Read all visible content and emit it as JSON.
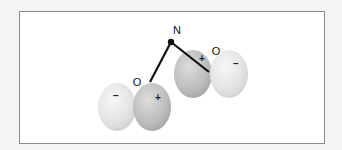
{
  "diagram": {
    "type": "molecular-polarity",
    "colors": {
      "background": "#f4f4f4",
      "frame_fill": "#ffffff",
      "frame_border": "#8a8a8a",
      "bond": "#111111",
      "negative_lobe": "#e6e6e6",
      "positive_lobe": "#bdbdbd"
    },
    "center_atom": {
      "label": "N"
    },
    "groups": [
      {
        "label": "O",
        "lobes": [
          {
            "sign": "−",
            "charge": "negative"
          },
          {
            "sign": "+",
            "charge": "positive"
          }
        ]
      },
      {
        "label": "O",
        "lobes": [
          {
            "sign": "+",
            "charge": "positive"
          },
          {
            "sign": "−",
            "charge": "negative"
          }
        ]
      }
    ]
  }
}
